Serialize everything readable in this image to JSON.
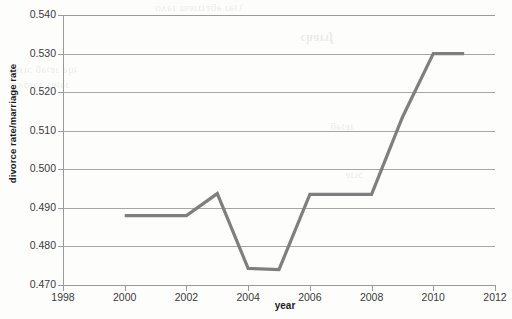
{
  "chart_data": {
    "type": "line",
    "title": "",
    "xlabel": "year",
    "ylabel": "divorce rate/marriage rate",
    "xlim": [
      1998,
      2012
    ],
    "ylim": [
      0.47,
      0.54
    ],
    "grid": true,
    "legend": "none",
    "x_ticks": [
      "1998",
      "2000",
      "2002",
      "2004",
      "2006",
      "2008",
      "2010",
      "2012"
    ],
    "y_ticks": [
      "0.470",
      "0.480",
      "0.490",
      "0.500",
      "0.510",
      "0.520",
      "0.530",
      "0.540"
    ],
    "x": [
      2000,
      2001,
      2002,
      2003,
      2004,
      2005,
      2006,
      2007,
      2008,
      2009,
      2010,
      2011
    ],
    "values": [
      0.488,
      0.488,
      0.488,
      0.4937,
      0.4743,
      0.474,
      0.4935,
      0.4935,
      0.4935,
      0.5135,
      0.53,
      0.53
    ],
    "series": [
      {
        "name": "divorce rate/marriage rate",
        "color": "#7f7f7f",
        "values": [
          0.488,
          0.488,
          0.488,
          0.4937,
          0.4743,
          0.474,
          0.4935,
          0.4935,
          0.4935,
          0.5135,
          0.53,
          0.53
        ]
      }
    ]
  },
  "colors": {
    "line": "#7f7f7f",
    "grid": "#a6a6a6",
    "axis": "#9a9a9a",
    "tick_text": "#3b3b3b",
    "axis_title": "#1c1c1c",
    "background": "#fdfdfc"
  },
  "background_bleed": {
    "line1": "ʅʇəɹ ǝƃɐıɹɹɐɯ ɹəʌo",
    "line2": "ʄıɹɐɥɔ",
    "line3": "ʇɥə ɹɐʇǝƃ ɔıɹɐɥ",
    "line4": "ɹǝʇɐɹ ǝɔɹoʌıp",
    "line5": "ɹɐʇǝƃ",
    "line6": "ɔıɹɐ"
  }
}
